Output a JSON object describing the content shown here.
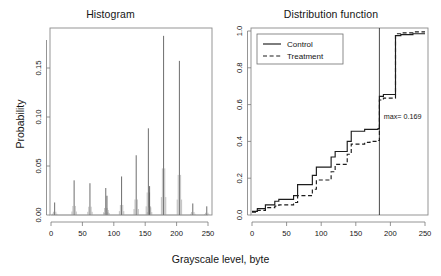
{
  "figure": {
    "shared_xlabel": "Grayscale level, byte",
    "background": "#ffffff"
  },
  "panels": {
    "histogram": {
      "title": "Histogram",
      "ylabel": "Probability",
      "xticks": [
        "0",
        "50",
        "100",
        "150",
        "200",
        "250"
      ],
      "yticks": [
        "0.00",
        "0.05",
        "0.10",
        "0.15"
      ]
    },
    "distribution": {
      "title": "Distribution function",
      "xticks": [
        "0",
        "50",
        "100",
        "150",
        "200",
        "250"
      ],
      "yticks": [
        "0.0",
        "0.2",
        "0.4",
        "0.6",
        "0.8",
        "1.0"
      ],
      "annotation": "max= 0.169",
      "legend": {
        "control_label": "Control",
        "treatment_label": "Treatment"
      }
    }
  },
  "chart_data": [
    {
      "type": "bar",
      "title": "Histogram",
      "xlabel": "Grayscale level, byte",
      "ylabel": "Probability",
      "xlim": [
        0,
        258
      ],
      "ylim": [
        0,
        0.19
      ],
      "grid": false,
      "xticks": [
        0,
        50,
        100,
        150,
        200,
        250
      ],
      "yticks": [
        0.0,
        0.05,
        0.1,
        0.15
      ],
      "note": "Sharp spikes at quantized grayscale levels; peak probability approx 0.186 at level 211.",
      "categories": [
        6,
        38,
        64,
        90,
        92,
        116,
        140,
        160,
        162,
        185,
        211,
        233,
        256
      ],
      "values": [
        0.013,
        0.036,
        0.033,
        0.028,
        0.02,
        0.04,
        0.062,
        0.09,
        0.03,
        0.186,
        0.16,
        0.012,
        0.009
      ]
    },
    {
      "type": "line",
      "title": "Distribution function",
      "xlabel": "Grayscale level, byte",
      "ylabel": "",
      "xlim": [
        0,
        258
      ],
      "ylim": [
        0,
        1.0
      ],
      "grid": false,
      "xticks": [
        0,
        50,
        100,
        150,
        200,
        250
      ],
      "yticks": [
        0.0,
        0.2,
        0.4,
        0.6,
        0.8,
        1.0
      ],
      "legend_position": "top-left",
      "annotations": [
        {
          "text": "max= 0.169",
          "x": 192,
          "y": 0.52
        }
      ],
      "vertical_line_x": 190,
      "series": [
        {
          "name": "Control",
          "style": "solid",
          "x": [
            0,
            8,
            20,
            34,
            40,
            62,
            68,
            90,
            96,
            118,
            124,
            142,
            148,
            168,
            176,
            188,
            190,
            196,
            214,
            222,
            240,
            258
          ],
          "values": [
            0.02,
            0.035,
            0.055,
            0.075,
            0.085,
            0.105,
            0.165,
            0.215,
            0.26,
            0.315,
            0.345,
            0.4,
            0.455,
            0.465,
            0.465,
            0.47,
            0.645,
            0.655,
            0.975,
            0.98,
            0.985,
            0.985
          ]
        },
        {
          "name": "Treatment",
          "style": "dashed",
          "x": [
            0,
            8,
            20,
            34,
            40,
            62,
            68,
            90,
            96,
            118,
            124,
            142,
            148,
            168,
            176,
            188,
            190,
            196,
            214,
            222,
            240,
            258
          ],
          "values": [
            0.015,
            0.025,
            0.04,
            0.048,
            0.055,
            0.068,
            0.105,
            0.14,
            0.19,
            0.235,
            0.275,
            0.33,
            0.385,
            0.395,
            0.4,
            0.405,
            0.625,
            0.635,
            0.985,
            0.99,
            0.995,
            0.995
          ]
        }
      ]
    }
  ]
}
